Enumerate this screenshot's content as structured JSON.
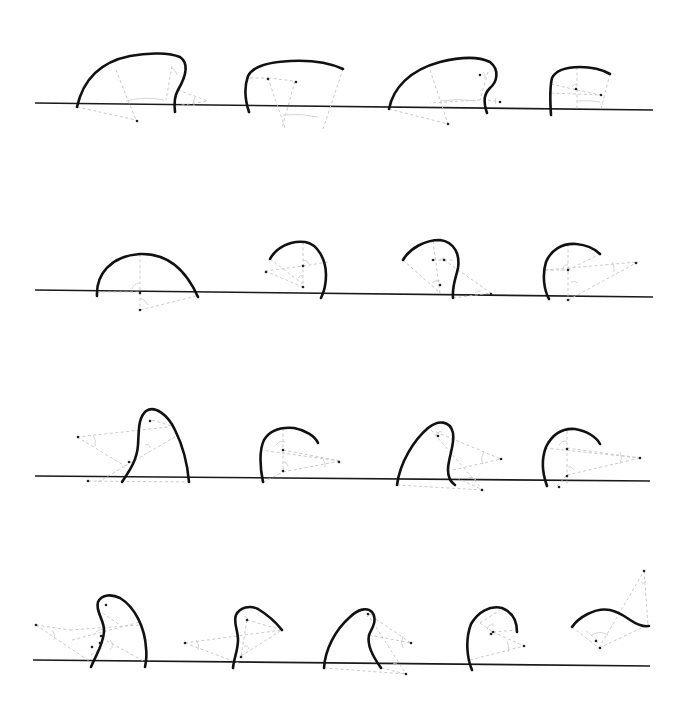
{
  "figure": {
    "colors": {
      "curve": "#111111",
      "baseline": "#1a1a1a",
      "construction": "#c4c4c4",
      "center_point": "#222222"
    },
    "rows": [
      {
        "baseline": [
          35,
          103,
          653,
          110
        ],
        "shapes": [
          {
            "curve": "M77,107 C83,80 100,62 130,56 C150,52 170,53 180,57 C190,64 185,78 178,90 C174,97 174,104 175,112",
            "construct": [
              "M77,107 L136,120",
              "M116,70 L136,120",
              "M172,66 L166,100",
              "M178,90 L208,101",
              "M176,106 L208,101"
            ],
            "arcs": [
              "M126,101 Q145,96 164,100",
              "M172,68 Q176,70 177,75",
              "M195,96 Q193,101 194,106"
            ],
            "centers": [
              [
                137,
                121
              ]
            ]
          },
          {
            "curve": "M249,112 C246,103 243,90 248,76 C253,66 270,62 290,61 C310,60 330,63 343,69",
            "construct": [
              "M250,78 L268,78",
              "M268,78 L295,81",
              "M268,78 L285,128",
              "M295,81 L282,128",
              "M343,69 L322,132"
            ],
            "arcs": [
              "M283,115 Q300,113 318,117"
            ],
            "centers": [
              [
                268,
                79
              ],
              [
                296,
                82
              ]
            ]
          },
          {
            "curve": "M389,109 C393,88 410,70 440,62 C460,57 478,56 490,62 C500,70 497,82 490,88 C484,94 483,101 487,113",
            "construct": [
              "M389,109 L448,124",
              "M430,70 L448,124",
              "M488,72 L480,100",
              "M488,100 L500,102",
              "M480,100 L430,103"
            ],
            "arcs": [
              "M440,101 Q458,98 476,101",
              "M483,72 Q486,75 485,79",
              "M496,98 Q494,101 496,104"
            ],
            "centers": [
              [
                448,
                124
              ],
              [
                480,
                75
              ],
              [
                500,
                102
              ]
            ]
          },
          {
            "curve": "M551,115 C550,100 550,86 552,78 C556,70 566,67 580,67 C592,67 603,70 610,74",
            "construct": [
              "M577,67 L577,109",
              "M551,84 L577,90",
              "M551,93 L601,95",
              "M577,90 L601,95",
              "M610,74 L601,109"
            ],
            "arcs": [
              "M578,101 Q590,100 600,102",
              "M572,87 Q574,84 577,84"
            ],
            "centers": [
              [
                576,
                89
              ],
              [
                601,
                95
              ]
            ]
          }
        ]
      },
      {
        "baseline": [
          35,
          290,
          653,
          297
        ],
        "shapes": [
          {
            "curve": "M97,296 C96,275 110,256 140,254 C165,253 185,268 198,297",
            "construct": [
              "M140,254 L140,310",
              "M97,292 L140,292",
              "M140,310 L196,296"
            ],
            "arcs": [
              "M132,289 Q134,283 140,283",
              "M140,298 Q146,300 148,305"
            ],
            "centers": [
              [
                140,
                293
              ],
              [
                140,
                310
              ]
            ]
          },
          {
            "curve": "M270,259 C276,248 290,240 305,242 C318,244 326,260 326,275 C326,285 324,292 321,298",
            "construct": [
              "M270,259 L303,284",
              "M265,271 L303,266",
              "M265,271 L303,287",
              "M303,242 L303,287",
              "M303,266 L328,262"
            ],
            "arcs": [
              "M303,260 Q308,260 309,264",
              "M298,278 Q300,275 303,275"
            ],
            "centers": [
              [
                266,
                272
              ],
              [
                303,
                266
              ],
              [
                303,
                287
              ]
            ]
          },
          {
            "curve": "M403,260 C410,248 425,240 440,240 C455,242 460,255 458,268 C456,278 452,285 453,298",
            "construct": [
              "M403,260 L440,293",
              "M433,241 L440,293",
              "M433,260 L453,260",
              "M444,260 L491,293",
              "M453,298 L491,293"
            ],
            "arcs": [
              "M432,283 Q436,279 440,281",
              "M475,293 Q477,290 481,291",
              "M440,260 Q444,256 446,260"
            ],
            "centers": [
              [
                433,
                260
              ],
              [
                444,
                260
              ],
              [
                440,
                285
              ],
              [
                491,
                294
              ]
            ]
          },
          {
            "curve": "M549,299 C544,290 542,275 546,262 C551,250 562,243 576,244 C587,245 595,249 600,254",
            "construct": [
              "M545,270 L638,262",
              "M568,244 L568,300",
              "M545,270 L568,270",
              "M568,270 L600,254",
              "M568,300 L638,262"
            ],
            "arcs": [
              "M562,270 Q563,265 568,264",
              "M612,262 Q615,266 614,272",
              "M571,282 Q574,280 578,283"
            ],
            "centers": [
              [
                568,
                270
              ],
              [
                568,
                300
              ],
              [
                636,
                263
              ]
            ]
          }
        ]
      },
      {
        "baseline": [
          35,
          476,
          650,
          481
        ],
        "shapes": [
          {
            "curve": "M122,482 C130,470 137,460 138,445 C139,430 138,418 146,411 C155,405 168,415 175,430 C185,450 188,470 189,482",
            "construct": [
              "M77,437 L168,427",
              "M77,437 L125,466",
              "M88,481 L189,482",
              "M125,466 L175,437",
              "M152,420 L175,427",
              "M98,482 L125,466"
            ],
            "arcs": [
              "M93,435 Q97,440 95,446",
              "M145,445 Q150,443 150,448"
            ],
            "centers": [
              [
                78,
                437
              ],
              [
                150,
                421
              ],
              [
                129,
                462
              ],
              [
                88,
                481
              ]
            ]
          },
          {
            "curve": "M263,482 C260,468 259,450 264,440 C270,430 282,427 294,428 C305,430 315,436 318,443",
            "construct": [
              "M283,428 L283,472",
              "M260,450 L340,461",
              "M283,450 L340,461",
              "M283,472 L340,461",
              "M263,482 L283,472"
            ],
            "arcs": [
              "M276,445 Q280,440 285,442",
              "M323,459 Q326,463 325,468",
              "M283,462 Q287,462 288,466"
            ],
            "centers": [
              [
                283,
                450
              ],
              [
                283,
                471
              ],
              [
                339,
                462
              ]
            ]
          },
          {
            "curve": "M397,485 C400,462 414,440 428,428 C438,420 450,420 453,433 C455,445 448,458 448,470 C448,478 452,483 455,485",
            "construct": [
              "M436,432 L501,459",
              "M431,430 L483,490",
              "M397,485 L483,490",
              "M453,470 L501,459",
              "M457,478 L483,490"
            ],
            "arcs": [
              "M436,436 Q438,430 442,432",
              "M484,452 Q480,458 483,464",
              "M468,478 Q472,476 476,480"
            ],
            "centers": [
              [
                438,
                436
              ],
              [
                501,
                459
              ],
              [
                482,
                490
              ]
            ]
          },
          {
            "curve": "M547,486 C543,475 541,460 546,447 C552,435 562,428 575,429 C588,431 597,438 600,444",
            "construct": [
              "M545,448 L640,458",
              "M567,431 L567,486",
              "M567,448 L640,458",
              "M567,475 L640,458",
              "M557,486 L567,475"
            ],
            "arcs": [
              "M559,445 Q562,440 567,441",
              "M620,452 Q623,457 620,464",
              "M568,467 Q572,466 574,470"
            ],
            "centers": [
              [
                567,
                449
              ],
              [
                567,
                476
              ],
              [
                640,
                458
              ],
              [
                559,
                487
              ]
            ]
          }
        ]
      },
      {
        "baseline": [
          33,
          660,
          650,
          666
        ],
        "shapes": [
          {
            "curve": "M91,667 C96,655 103,645 104,632 C105,620 95,612 98,602 C102,594 112,594 120,598 C135,607 145,628 146,648 C147,655 146,662 145,667",
            "construct": [
              "M36,625 L92,663",
              "M36,625 L70,630",
              "M70,630 L140,625",
              "M102,638 L145,662",
              "M72,640 L140,622",
              "M98,610 L120,625",
              "M91,655 L102,648"
            ],
            "arcs": [
              "M52,630 Q56,634 54,640",
              "M96,632 Q100,628 105,630",
              "M110,640 Q115,645 110,650"
            ],
            "centers": [
              [
                36,
                625
              ],
              [
                106,
                605
              ],
              [
                101,
                636
              ],
              [
                100,
                643
              ],
              [
                92,
                647
              ]
            ]
          },
          {
            "curve": "M233,668 C234,658 238,650 238,640 C238,630 233,622 236,615 C240,607 250,605 258,609 C268,615 278,625 282,630",
            "construct": [
              "M185,643 L282,630",
              "M185,643 L241,664",
              "M247,620 L241,656",
              "M247,620 L282,630",
              "M241,656 L282,630"
            ],
            "arcs": [
              "M196,640 Q200,645 198,650",
              "M244,616 Q248,617 248,620",
              "M244,646 Q248,645 249,649"
            ],
            "centers": [
              [
                185,
                643
              ],
              [
                247,
                620
              ],
              [
                241,
                657
              ]
            ]
          },
          {
            "curve": "M324,668 C325,650 335,630 350,617 C358,609 367,607 372,612 C378,620 372,628 369,635 C367,645 372,655 381,668",
            "construct": [
              "M367,613 L411,643",
              "M369,635 L411,643",
              "M324,668 L406,674",
              "M367,613 L406,674",
              "M381,668 L406,674"
            ],
            "arcs": [
              "M367,617 Q369,613 372,615",
              "M403,636 Q400,642 403,648",
              "M393,664 Q396,662 398,665"
            ],
            "centers": [
              [
                368,
                614
              ],
              [
                411,
                643
              ],
              [
                406,
                674
              ]
            ]
          },
          {
            "curve": "M472,670 C467,658 465,640 471,624 C478,612 490,605 502,608 C512,612 517,620 517,632",
            "construct": [
              "M480,623 L493,632",
              "M493,632 L524,646",
              "M493,632 L517,630",
              "M470,660 L524,646",
              "M480,623 L500,610"
            ],
            "arcs": [
              "M487,630 Q488,624 494,624",
              "M507,641 Q510,646 508,652"
            ],
            "centers": [
              [
                493,
                632
              ],
              [
                491,
                634
              ],
              [
                524,
                646
              ]
            ]
          },
          {
            "curve": "M572,627 C578,618 595,607 610,610 C624,613 630,622 640,625 C645,627 648,626 649,626",
            "construct": [
              "M572,627 L599,648",
              "M599,648 L648,625",
              "M599,648 L644,571",
              "M644,571 L648,625",
              "M597,640 L585,630"
            ],
            "arcs": [
              "M592,635 Q600,630 608,635",
              "M641,582 Q644,585 646,581"
            ],
            "centers": [
              [
                596,
                641
              ],
              [
                600,
                648
              ],
              [
                644,
                571
              ]
            ]
          }
        ]
      }
    ]
  }
}
